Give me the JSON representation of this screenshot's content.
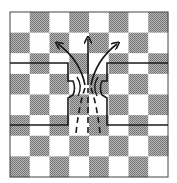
{
  "diagram": {
    "board": {
      "x": 10,
      "y": 12,
      "width": 158,
      "height": 165,
      "rows": 8,
      "cols": 8,
      "first_cell": "light",
      "light_color": "#ffffff",
      "dark_color": "#9a9a9a",
      "border_color": "#444444"
    },
    "boundary_color": "#1a1a1a",
    "flow_color": "#1a1a1a",
    "arrows": [
      {
        "name": "left-arrow",
        "direction": "up-left"
      },
      {
        "name": "center-arrow",
        "direction": "up"
      },
      {
        "name": "right-arrow",
        "direction": "up-right"
      }
    ],
    "dashed_paths": 3,
    "inner_arcs": 4
  }
}
